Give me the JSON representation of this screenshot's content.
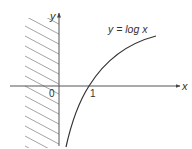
{
  "diagram": {
    "curve_label": "y = log x",
    "axes": {
      "x_label": "x",
      "y_label": "y"
    },
    "tick_labels": {
      "origin": "0",
      "x_intercept": "1"
    },
    "shaded_region": "x ≤ 0 (hatched, domain excluded)",
    "colors": {
      "axis": "#555555",
      "curve": "#333333",
      "hatch": "#9a9a9a",
      "text": "#333333"
    }
  }
}
